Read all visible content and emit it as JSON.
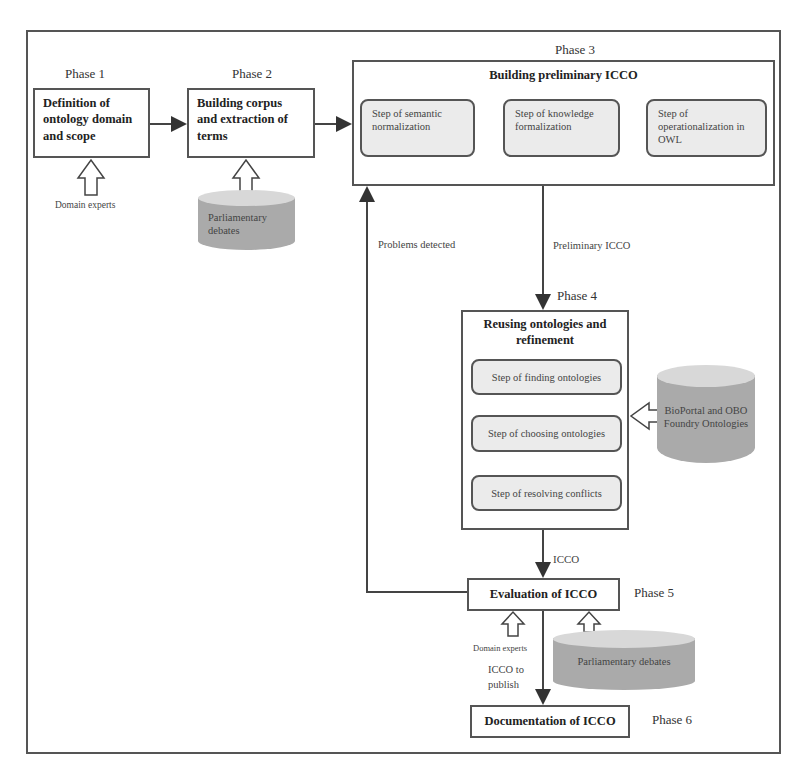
{
  "phases": {
    "p1": {
      "label": "Phase 1",
      "title": "Definition of ontology domain and scope",
      "input": "Domain experts"
    },
    "p2": {
      "label": "Phase 2",
      "title": "Building corpus and extraction of terms",
      "input": "Parliamentary debates"
    },
    "p3": {
      "label": "Phase 3",
      "title": "Building preliminary ICCO",
      "steps": [
        "Step of semantic normalization",
        "Step of knowledge formalization",
        "Step of operationalization in OWL"
      ]
    },
    "p4": {
      "label": "Phase 4",
      "title": "Reusing ontologies and refinement",
      "steps": [
        "Step of finding ontologies",
        "Step of choosing ontologies",
        "Step of resolving conflicts"
      ],
      "input": "BioPortal and OBO Foundry Ontologies"
    },
    "p5": {
      "label": "Phase 5",
      "title": "Evaluation of ICCO",
      "input_experts": "Domain experts",
      "input_db": "Parliamentary debates"
    },
    "p6": {
      "label": "Phase 6",
      "title": "Documentation of ICCO"
    }
  },
  "edges": {
    "p3_to_p4": "Preliminary ICCO",
    "feedback": "Problems detected",
    "p4_to_p5": "ICCO",
    "p5_to_p6": "ICCO to publish"
  }
}
